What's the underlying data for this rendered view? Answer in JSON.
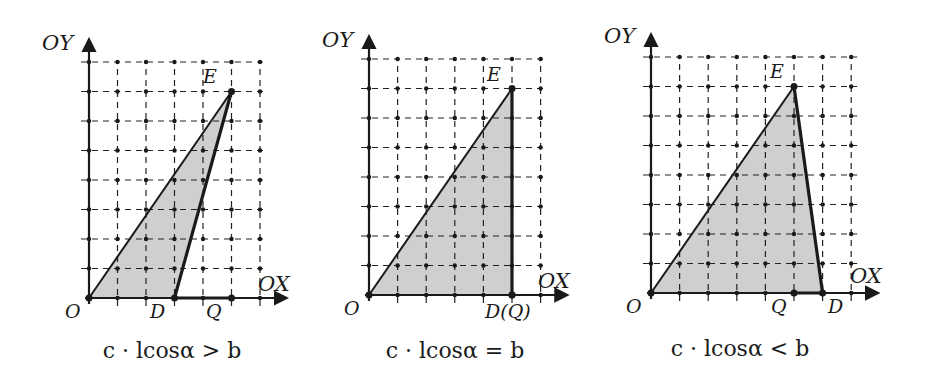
{
  "figure": {
    "colors": {
      "fill": "#cfcfcf",
      "stroke": "#1a1a1a",
      "background": "#ffffff"
    },
    "axis_labels": {
      "x": "OX",
      "y": "OY"
    },
    "panels": [
      {
        "id": "greater",
        "caption": "c · lcosα > b",
        "origin_label": "O",
        "points": {
          "O": [
            0,
            0
          ],
          "E": [
            5,
            7
          ],
          "D": [
            3,
            0
          ],
          "Q": [
            5,
            0
          ]
        },
        "labels": {
          "E": "E",
          "D": "D",
          "Q": "Q"
        },
        "grid": {
          "cols": 6,
          "rows": 8
        }
      },
      {
        "id": "equal",
        "caption": "c · lcosα = b",
        "origin_label": "O",
        "points": {
          "O": [
            0,
            0
          ],
          "E": [
            5,
            7
          ],
          "D": [
            5,
            0
          ],
          "Q": [
            5,
            0
          ]
        },
        "labels": {
          "E": "E",
          "DQ": "D(Q)"
        },
        "grid": {
          "cols": 6,
          "rows": 8
        }
      },
      {
        "id": "less",
        "caption": "c · lcosα < b",
        "origin_label": "O",
        "points": {
          "O": [
            0,
            0
          ],
          "E": [
            5,
            7
          ],
          "D": [
            6,
            0
          ],
          "Q": [
            5,
            0
          ]
        },
        "labels": {
          "E": "E",
          "D": "D",
          "Q": "Q"
        },
        "grid": {
          "cols": 7,
          "rows": 8
        }
      }
    ]
  }
}
